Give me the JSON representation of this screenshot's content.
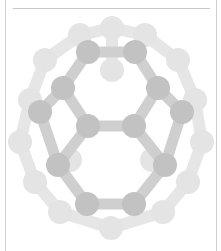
{
  "figure": {
    "colors": {
      "background": "#ffffff",
      "border": "#d0d0d0",
      "rule": "#c8c8c8",
      "atom_front": "#c2c2c2",
      "atom_mid": "#d2d2d2",
      "atom_back": "#e4e4e4",
      "bond_front": "#cfcfcf",
      "bond_back": "#e6e6e6"
    },
    "atoms_back": [
      [
        80,
        35
      ],
      [
        112,
        28
      ],
      [
        145,
        35
      ],
      [
        45,
        60
      ],
      [
        178,
        60
      ],
      [
        30,
        100
      ],
      [
        195,
        100
      ],
      [
        20,
        142
      ],
      [
        202,
        142
      ],
      [
        35,
        182
      ],
      [
        188,
        182
      ],
      [
        60,
        212
      ],
      [
        163,
        212
      ],
      [
        111,
        228
      ],
      [
        112,
        70
      ],
      [
        70,
        160
      ],
      [
        152,
        160
      ]
    ],
    "atoms_front": [
      [
        88,
        52
      ],
      [
        135,
        52
      ],
      [
        63,
        88
      ],
      [
        158,
        88
      ],
      [
        88,
        126
      ],
      [
        134,
        126
      ],
      [
        40,
        112
      ],
      [
        182,
        112
      ],
      [
        58,
        165
      ],
      [
        165,
        165
      ],
      [
        87,
        204
      ],
      [
        134,
        204
      ]
    ],
    "bonds_back": [
      [
        0,
        1
      ],
      [
        1,
        2
      ],
      [
        0,
        3
      ],
      [
        2,
        4
      ],
      [
        3,
        5
      ],
      [
        4,
        6
      ],
      [
        5,
        7
      ],
      [
        6,
        8
      ],
      [
        7,
        9
      ],
      [
        8,
        10
      ],
      [
        9,
        11
      ],
      [
        10,
        12
      ],
      [
        11,
        13
      ],
      [
        12,
        13
      ],
      [
        1,
        14
      ]
    ],
    "bonds_front": [
      [
        0,
        1
      ],
      [
        0,
        2
      ],
      [
        1,
        3
      ],
      [
        2,
        4
      ],
      [
        3,
        5
      ],
      [
        4,
        5
      ],
      [
        2,
        6
      ],
      [
        3,
        7
      ],
      [
        6,
        8
      ],
      [
        7,
        9
      ],
      [
        8,
        10
      ],
      [
        9,
        11
      ],
      [
        10,
        11
      ],
      [
        4,
        8
      ],
      [
        5,
        9
      ]
    ]
  }
}
